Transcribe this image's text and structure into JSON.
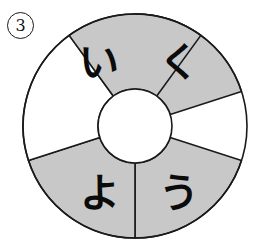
{
  "page": {
    "background_color": "#ffffff",
    "width": 258,
    "height": 246
  },
  "item": {
    "number_label": "3",
    "marker_style": "circled-number",
    "name": "item-number-3"
  },
  "wheel": {
    "name": "segmented-ring-wheel",
    "center_x": 135,
    "center_y": 126,
    "outer_radius": 112,
    "inner_radius": 37,
    "segment_count": 5,
    "segment_angle_degrees": 72,
    "stroke_color": "#1a1a1a",
    "stroke_width": 1.6,
    "filled_color": "#c8c8c8",
    "empty_color": "#ffffff",
    "segments": [
      {
        "id": "segment-upper-right",
        "label": "く",
        "romaji": "ku",
        "filled": true,
        "fill_color": "#c8c8c8",
        "start_angle_degrees": -90,
        "end_angle_degrees": -18,
        "label_x": 179,
        "label_y": 62
      },
      {
        "id": "segment-lower-right",
        "label": "う",
        "romaji": "u",
        "filled": true,
        "fill_color": "#c8c8c8",
        "start_angle_degrees": 18,
        "end_angle_degrees": 90,
        "label_x": 179,
        "label_y": 193
      },
      {
        "id": "segment-lower-left",
        "label": "よ",
        "romaji": "yo",
        "filled": true,
        "fill_color": "#c8c8c8",
        "start_angle_degrees": 90,
        "end_angle_degrees": 162,
        "label_x": 100,
        "label_y": 193
      },
      {
        "id": "segment-left",
        "label": "",
        "romaji": "",
        "filled": false,
        "fill_color": "#ffffff",
        "start_angle_degrees": 162,
        "end_angle_degrees": 234,
        "label_x": 52,
        "label_y": 126
      },
      {
        "id": "segment-upper-left",
        "label": "い",
        "romaji": "i",
        "filled": true,
        "fill_color": "#c8c8c8",
        "start_angle_degrees": 234,
        "end_angle_degrees": 270,
        "label_x": 99,
        "label_y": 62
      }
    ]
  }
}
